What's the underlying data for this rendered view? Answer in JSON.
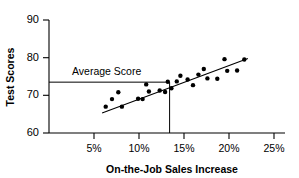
{
  "chart_data": {
    "type": "scatter",
    "title": "",
    "xlabel": "On-the-Job Sales Increase",
    "ylabel": "Test Scores",
    "xlim": [
      0,
      25
    ],
    "ylim": [
      60,
      90
    ],
    "xticks": [
      5,
      10,
      15,
      20,
      25
    ],
    "xtick_labels": [
      "5%",
      "10%",
      "15%",
      "20%",
      "25%"
    ],
    "yticks": [
      60,
      70,
      80,
      90
    ],
    "ytick_labels": [
      "60",
      "70",
      "80",
      "90"
    ],
    "grid": false,
    "legend": "none",
    "points": [
      {
        "x": 6.3,
        "y": 67.0
      },
      {
        "x": 7.0,
        "y": 69.0
      },
      {
        "x": 7.7,
        "y": 70.8
      },
      {
        "x": 8.1,
        "y": 67.0
      },
      {
        "x": 9.9,
        "y": 69.1
      },
      {
        "x": 10.4,
        "y": 69.0
      },
      {
        "x": 10.8,
        "y": 72.9
      },
      {
        "x": 11.1,
        "y": 71.0
      },
      {
        "x": 12.3,
        "y": 71.3
      },
      {
        "x": 12.9,
        "y": 70.9
      },
      {
        "x": 13.2,
        "y": 73.6
      },
      {
        "x": 13.6,
        "y": 71.9
      },
      {
        "x": 14.2,
        "y": 73.7
      },
      {
        "x": 14.6,
        "y": 75.2
      },
      {
        "x": 15.4,
        "y": 74.2
      },
      {
        "x": 16.0,
        "y": 72.7
      },
      {
        "x": 16.6,
        "y": 75.5
      },
      {
        "x": 17.2,
        "y": 77.0
      },
      {
        "x": 17.6,
        "y": 74.5
      },
      {
        "x": 18.7,
        "y": 74.4
      },
      {
        "x": 19.5,
        "y": 79.6
      },
      {
        "x": 19.8,
        "y": 76.5
      },
      {
        "x": 20.9,
        "y": 76.6
      },
      {
        "x": 21.7,
        "y": 79.5
      }
    ],
    "trend_line": {
      "x0": 5.9,
      "y0": 65.3,
      "x1": 22.1,
      "y1": 79.8
    },
    "average_score": {
      "label": "Average Score",
      "y": 73.5,
      "x_intercept": 13.4
    }
  }
}
